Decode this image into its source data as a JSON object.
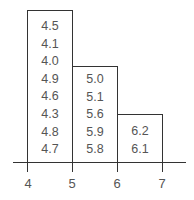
{
  "diagram": {
    "type": "stem-and-box histogram",
    "bins": [
      {
        "range": "4-5",
        "values": [
          "4.5",
          "4.1",
          "4.0",
          "4.9",
          "4.6",
          "4.3",
          "4.8",
          "4.7"
        ]
      },
      {
        "range": "5-6",
        "values": [
          "5.0",
          "5.1",
          "5.6",
          "5.9",
          "5.8"
        ]
      },
      {
        "range": "6-7",
        "values": [
          "6.2",
          "6.1"
        ]
      }
    ],
    "axis": {
      "ticks": [
        "4",
        "5",
        "6",
        "7"
      ]
    }
  }
}
